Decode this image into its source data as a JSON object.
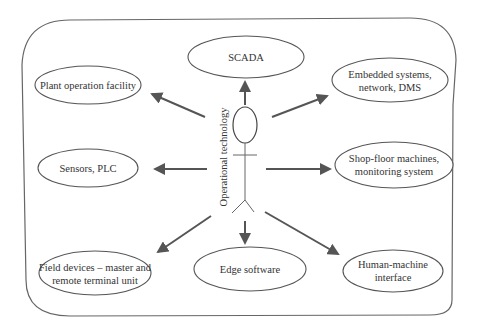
{
  "diagram": {
    "actor": {
      "label": "Operational technology"
    },
    "nodes": [
      {
        "id": "scada",
        "lines": [
          "SCADA"
        ]
      },
      {
        "id": "plant",
        "lines": [
          "Plant operation facility"
        ]
      },
      {
        "id": "embedded",
        "lines": [
          "Embedded systems,",
          "network, DMS"
        ]
      },
      {
        "id": "sensors",
        "lines": [
          "Sensors, PLC"
        ]
      },
      {
        "id": "shopfloor",
        "lines": [
          "Shop-floor machines,",
          "monitoring system"
        ]
      },
      {
        "id": "field",
        "lines": [
          "Field devices – master and",
          "remote terminal unit"
        ]
      },
      {
        "id": "edge",
        "lines": [
          "Edge software"
        ]
      },
      {
        "id": "hmi",
        "lines": [
          "Human-machine",
          "interface"
        ]
      }
    ],
    "colors": {
      "stroke": "#555555",
      "arrow": "#555555",
      "text": "#333333",
      "background": "#ffffff"
    }
  }
}
